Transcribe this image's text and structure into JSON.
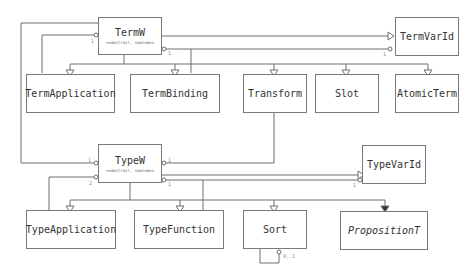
{
  "diagram": {
    "type": "uml-class-diagram",
    "classes": [
      {
        "id": "TermW",
        "name": "TermW",
        "stereotype": "<<abstract, sealed>>"
      },
      {
        "id": "TermVarId",
        "name": "TermVarId"
      },
      {
        "id": "TermApplication",
        "name": "TermApplication"
      },
      {
        "id": "TermBinding",
        "name": "TermBinding"
      },
      {
        "id": "Transform",
        "name": "Transform"
      },
      {
        "id": "Slot",
        "name": "Slot"
      },
      {
        "id": "AtomicTerm",
        "name": "AtomicTerm"
      },
      {
        "id": "TypeW",
        "name": "TypeW",
        "stereotype": "<<abstract, sealed>>"
      },
      {
        "id": "TypeVarId",
        "name": "TypeVarId"
      },
      {
        "id": "TypeApplication",
        "name": "TypeApplication"
      },
      {
        "id": "TypeFunction",
        "name": "TypeFunction"
      },
      {
        "id": "Sort",
        "name": "Sort"
      },
      {
        "id": "PropositionT",
        "name": "PropositionT",
        "italic": true
      }
    ],
    "multiplicities": {
      "termw_left": "1",
      "termw_right": "1",
      "termvarid": "1",
      "typew_left_top": "1",
      "typew_left_bottom": "2",
      "typew_right_top": "1",
      "typew_right_bottom": "1",
      "typew_bottom": "1",
      "typevarid": "1",
      "sort_self": "0..1"
    },
    "relations": [
      {
        "from": "TermApplication",
        "to": "TermW",
        "kind": "generalization"
      },
      {
        "from": "TermBinding",
        "to": "TermW",
        "kind": "generalization"
      },
      {
        "from": "Transform",
        "to": "TermW",
        "kind": "generalization"
      },
      {
        "from": "Slot",
        "to": "TermW",
        "kind": "generalization"
      },
      {
        "from": "AtomicTerm",
        "to": "TermW",
        "kind": "generalization"
      },
      {
        "from": "TermW",
        "to": "TermVarId",
        "kind": "generalization"
      },
      {
        "from": "TermVarId",
        "to": "TermW",
        "kind": "aggregation"
      },
      {
        "from": "TermApplication",
        "to": "TermW",
        "kind": "aggregation"
      },
      {
        "from": "TypeW",
        "to": "TermW",
        "kind": "aggregation"
      },
      {
        "from": "TypeApplication",
        "to": "TypeW",
        "kind": "generalization"
      },
      {
        "from": "TypeFunction",
        "to": "TypeW",
        "kind": "generalization"
      },
      {
        "from": "Sort",
        "to": "TypeW",
        "kind": "generalization"
      },
      {
        "from": "PropositionT",
        "to": "TypeW",
        "kind": "generalization"
      },
      {
        "from": "TypeW",
        "to": "TypeVarId",
        "kind": "generalization"
      },
      {
        "from": "TypeVarId",
        "to": "TypeW",
        "kind": "aggregation"
      },
      {
        "from": "Transform",
        "to": "TypeW",
        "kind": "aggregation"
      },
      {
        "from": "TypeApplication",
        "to": "TypeW",
        "kind": "aggregation"
      },
      {
        "from": "TypeFunction",
        "to": "TypeW",
        "kind": "aggregation"
      },
      {
        "from": "Sort",
        "to": "Sort",
        "kind": "aggregation"
      }
    ]
  }
}
